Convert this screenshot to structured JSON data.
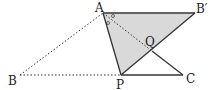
{
  "diagram": {
    "points": {
      "A": {
        "label": "A",
        "x": 103,
        "y": 13
      },
      "B_prime": {
        "label": "B′",
        "x": 195,
        "y": 13
      },
      "B": {
        "label": "B",
        "x": 20,
        "y": 75
      },
      "P": {
        "label": "P",
        "x": 121,
        "y": 75
      },
      "C": {
        "label": "C",
        "x": 183,
        "y": 75
      },
      "Q": {
        "label": "Q",
        "x": 152,
        "y": 51
      }
    },
    "shaded_region": "triangle AB′P",
    "solid_segments": [
      "AB′",
      "AP",
      "PB′",
      "QC",
      "PC"
    ],
    "dotted_segments": [
      "BA",
      "BP",
      "AQ"
    ],
    "angle_marks": "two equal angle marks (○) at vertex A",
    "colors": {
      "shade": "#d9d9d9",
      "line": "#333333"
    }
  }
}
